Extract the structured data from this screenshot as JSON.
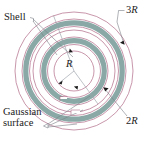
{
  "figure": {
    "type": "physics-diagram",
    "center": {
      "x": 74,
      "y": 71
    },
    "colors": {
      "shell": "#8aa9a6",
      "gaussian": "#b06a86",
      "leader": "#7a7f86",
      "text": "#1a1a1a",
      "background": "#ffffff"
    },
    "shells": [
      {
        "name": "inner-shell",
        "radius": 30,
        "thickness": 5.5,
        "color": "#8aa9a6"
      },
      {
        "name": "outer-shell",
        "radius": 48,
        "thickness": 5.5,
        "color": "#8aa9a6"
      }
    ],
    "gaussian_circles": [
      {
        "name": "gaussian-r",
        "radius": 20
      },
      {
        "name": "gaussian-inner-a",
        "radius": 27
      },
      {
        "name": "gaussian-inner-b",
        "radius": 34
      },
      {
        "name": "gaussian-mid",
        "radius": 41
      },
      {
        "name": "gaussian-outer-a",
        "radius": 45
      },
      {
        "name": "gaussian-outer-b",
        "radius": 52
      },
      {
        "name": "gaussian-outermost",
        "radius": 59
      }
    ],
    "radii_lines": [
      {
        "name": "radius-R",
        "angle_deg": 215,
        "length": 20
      },
      {
        "name": "radius-2R",
        "angle_deg": 55,
        "length": 41
      },
      {
        "name": "radius-3R",
        "angle_deg": 110,
        "length": 59
      }
    ]
  },
  "labels": {
    "shell": "Shell",
    "gaussian_line1": "Gaussian",
    "gaussian_line2": "surface",
    "radius_3r_coeff": "3",
    "radius_3r_symbol": "R",
    "radius_2r_coeff": "2",
    "radius_2r_symbol": "R",
    "radius_r_symbol": "R"
  }
}
